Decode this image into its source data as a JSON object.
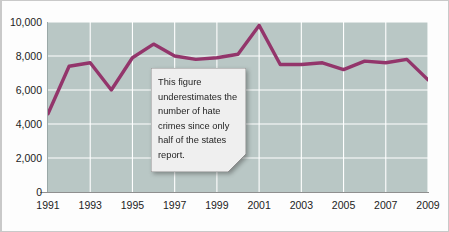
{
  "chart_data": {
    "type": "line",
    "title": "",
    "subtitle": "",
    "xlabel": "",
    "ylabel": "",
    "grid": true,
    "legend": "none",
    "line_color": "#93356b",
    "plot_background": "#b9c7c5",
    "gridline_color": "#ffffff",
    "xlim": [
      1991,
      2009
    ],
    "ylim": [
      0,
      10000
    ],
    "y_ticks": [
      "0",
      "2,000",
      "4,000",
      "6,000",
      "8,000",
      "10,000"
    ],
    "y_tick_values": [
      0,
      2000,
      4000,
      6000,
      8000,
      10000
    ],
    "x_ticks": [
      "1991",
      "1993",
      "1995",
      "1997",
      "1999",
      "2001",
      "2003",
      "2005",
      "2007",
      "2009"
    ],
    "x_tick_values": [
      1991,
      1993,
      1995,
      1997,
      1999,
      2001,
      2003,
      2005,
      2007,
      2009
    ],
    "x": [
      1991,
      1992,
      1993,
      1994,
      1995,
      1996,
      1997,
      1998,
      1999,
      2000,
      2001,
      2002,
      2003,
      2004,
      2005,
      2006,
      2007,
      2008,
      2009
    ],
    "values": [
      4600,
      7400,
      7600,
      6000,
      7900,
      8700,
      8000,
      7800,
      7900,
      8100,
      9800,
      7500,
      7500,
      7600,
      7200,
      7700,
      7600,
      7800,
      6600
    ],
    "series": [
      {
        "name": "Hate crimes reported",
        "values": [
          4600,
          7400,
          7600,
          6000,
          7900,
          8700,
          8000,
          7800,
          7900,
          8100,
          9800,
          7500,
          7500,
          7600,
          7200,
          7700,
          7600,
          7800,
          6600
        ]
      }
    ],
    "annotations": [
      {
        "name": "underreporting-note",
        "text": "This figure underestimates the number of hate crimes since only half of the states report.",
        "lines": [
          "This figure",
          "underestimates the",
          "number of hate",
          "crimes since only",
          "half of the states",
          "report."
        ]
      }
    ]
  },
  "callout": {
    "background": "#efefef",
    "border": "#8d8d8d",
    "text": "This figure underestimates the number of hate crimes since only half of the states report."
  }
}
